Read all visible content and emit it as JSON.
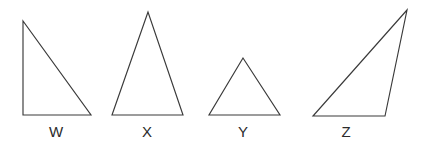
{
  "figure": {
    "name": "four-triangles-comparison",
    "background_color": "#ffffff",
    "stroke_color": "#3a3a3a",
    "label_color": "#2b2b2b",
    "width": 427,
    "height": 146
  },
  "shapes": [
    {
      "label": "W",
      "kind": "right triangle",
      "points": "23,21 23,115 91,115",
      "label_x": 56,
      "label_y": 124
    },
    {
      "label": "X",
      "kind": "isosceles triangle",
      "points": "148,12 112,115 183,115",
      "label_x": 147,
      "label_y": 124
    },
    {
      "label": "Y",
      "kind": "small isosceles triangle",
      "points": "243,58 209,115 280,115",
      "label_x": 243,
      "label_y": 124
    },
    {
      "label": "Z",
      "kind": "scalene triangle",
      "points": "407,10 313,116 385,116",
      "label_x": 346,
      "label_y": 124
    }
  ]
}
